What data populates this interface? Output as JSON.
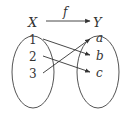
{
  "diagram": {
    "domain_label": "X",
    "codomain_label": "Y",
    "function_label": "f",
    "domain_elements": [
      "1",
      "2",
      "3"
    ],
    "codomain_elements": [
      "a",
      "b",
      "c"
    ],
    "mappings": [
      {
        "from": "1",
        "to": "b"
      },
      {
        "from": "2",
        "to": "c"
      },
      {
        "from": "3",
        "to": "a"
      }
    ],
    "stroke_color": "#333333"
  }
}
